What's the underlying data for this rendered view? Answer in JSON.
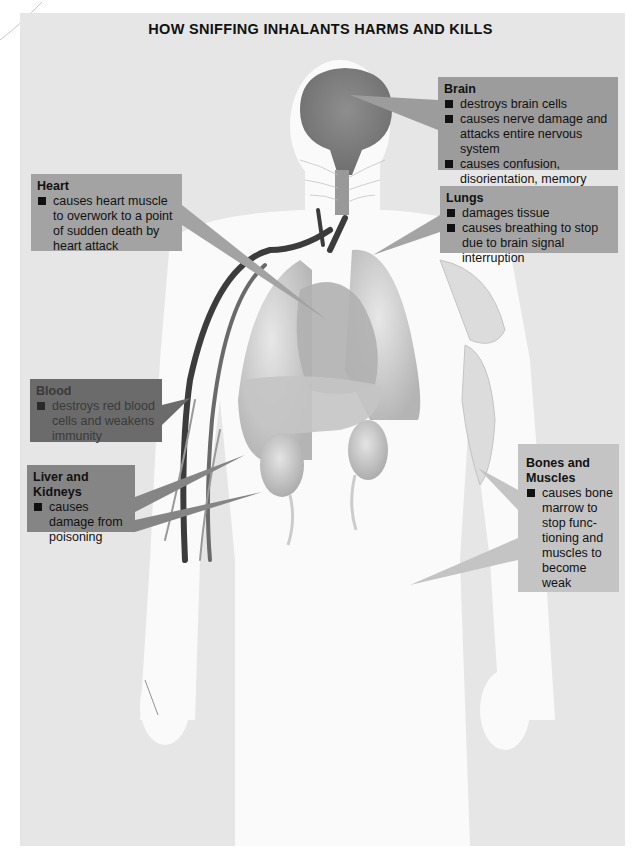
{
  "title": "HOW SNIFFING INHALANTS HARMS AND KILLS",
  "colors": {
    "panel_background": "#e6e6e6",
    "body_silhouette": "#fafafa",
    "organ_gray": "#bdbdbd",
    "brain_gray": "#8a8a8a",
    "vein_dark": "#3c3c3c",
    "text": "#111111"
  },
  "callouts": {
    "brain": {
      "heading": "Brain",
      "items": [
        "destroys brain cells",
        "causes nerve damage and attacks entire nervous system",
        "causes confusion, disorientation, memory loss"
      ]
    },
    "lungs": {
      "heading": "Lungs",
      "items": [
        "damages tissue",
        "causes breathing to stop due to brain signal interruption"
      ]
    },
    "heart": {
      "heading": "Heart",
      "items": [
        "causes heart muscle to overwork to a point of sudden death by heart attack"
      ]
    },
    "blood": {
      "heading": "Blood",
      "items": [
        "destroys red blood cells and weakens immunity"
      ]
    },
    "liver_kidneys": {
      "heading": "Liver and Kidneys",
      "items": [
        "causes damage from poisoning"
      ]
    },
    "bones_muscles": {
      "heading": "Bones and Muscles",
      "items": [
        "causes bone marrow to stop func-tioning and muscles to become weak"
      ]
    }
  }
}
